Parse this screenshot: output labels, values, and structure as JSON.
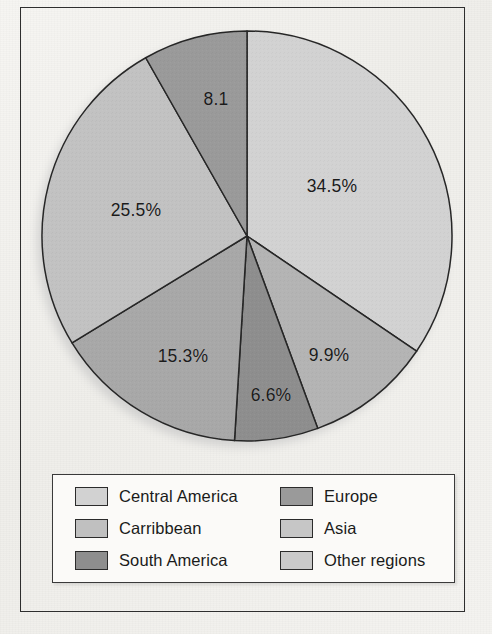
{
  "figure": {
    "background_color": "#f2f1ee",
    "frame_color": "#2e2e2e"
  },
  "chart_data": {
    "type": "pie",
    "title": "",
    "subtitle": "",
    "xlabel": "",
    "ylabel": "",
    "grid": false,
    "legend_position": "bottom",
    "start_angle_deg": 0,
    "direction": "clockwise",
    "categories": [
      "Central America",
      "Asia",
      "South America",
      "Carribbean",
      "Other regions",
      "Europe"
    ],
    "values": [
      34.5,
      9.9,
      6.6,
      15.3,
      25.5,
      8.1
    ],
    "data_labels": [
      "34.5%",
      "9.9%",
      "6.6%",
      "15.3%",
      "25.5%",
      "8.1"
    ],
    "colors": [
      "#d2d2d2",
      "#b4b4b4",
      "#8e8e8e",
      "#a8a8a8",
      "#c2c2c2",
      "#9a9a9a"
    ],
    "slice_border_color": "#262626",
    "annotations": []
  },
  "pie": {
    "center_x": 247,
    "center_y": 236,
    "radius": 205,
    "slices": [
      {
        "name": "Central America",
        "label": "34.5%",
        "value": 34.5,
        "color": "#d2d2d2",
        "start": 0,
        "end": 124.2,
        "label_x": 332,
        "label_y": 186
      },
      {
        "name": "Asia",
        "label": "9.9%",
        "value": 9.9,
        "color": "#b4b4b4",
        "start": 124.2,
        "end": 159.8,
        "label_x": 329,
        "label_y": 355
      },
      {
        "name": "South America",
        "label": "6.6%",
        "value": 6.6,
        "color": "#8e8e8e",
        "start": 159.8,
        "end": 183.5,
        "label_x": 271,
        "label_y": 395
      },
      {
        "name": "Carribbean",
        "label": "15.3%",
        "value": 15.3,
        "color": "#a8a8a8",
        "start": 183.5,
        "end": 238.6,
        "label_x": 183,
        "label_y": 356
      },
      {
        "name": "Other regions",
        "label": "25.5%",
        "value": 25.5,
        "color": "#c2c2c2",
        "start": 238.6,
        "end": 330.4,
        "label_x": 136,
        "label_y": 210
      },
      {
        "name": "Europe",
        "label": "8.1",
        "value": 8.1,
        "color": "#9a9a9a",
        "start": 330.4,
        "end": 360.0,
        "label_x": 216,
        "label_y": 99
      }
    ]
  },
  "legend": {
    "items": [
      {
        "label": "Central America",
        "color": "#d2d2d2",
        "column": 0,
        "row": 0
      },
      {
        "label": "Carribbean",
        "color": "#c0c0c0",
        "column": 0,
        "row": 1
      },
      {
        "label": "South America",
        "color": "#8e8e8e",
        "column": 0,
        "row": 2
      },
      {
        "label": "Europe",
        "color": "#9a9a9a",
        "column": 1,
        "row": 0
      },
      {
        "label": "Asia",
        "color": "#c6c6c6",
        "column": 1,
        "row": 1
      },
      {
        "label": "Other regions",
        "color": "#cacaca",
        "column": 1,
        "row": 2
      }
    ]
  }
}
